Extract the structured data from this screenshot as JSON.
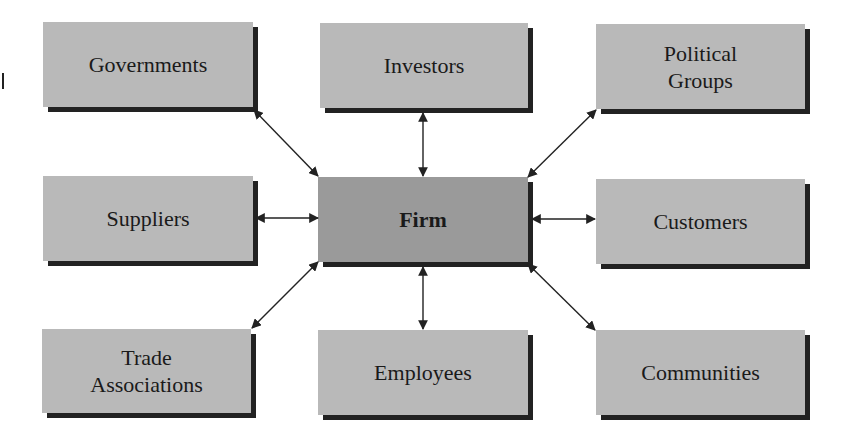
{
  "diagram": {
    "type": "stakeholder-hub",
    "center": {
      "id": "firm",
      "label": "Firm",
      "x": 318,
      "y": 177,
      "w": 210,
      "h": 85
    },
    "nodes": [
      {
        "id": "governments",
        "label": "Governments",
        "x": 43,
        "y": 22,
        "w": 210,
        "h": 85
      },
      {
        "id": "investors",
        "label": "Investors",
        "x": 320,
        "y": 23,
        "w": 208,
        "h": 85
      },
      {
        "id": "political-groups",
        "label": "Political\nGroups",
        "x": 596,
        "y": 24,
        "w": 209,
        "h": 85
      },
      {
        "id": "suppliers",
        "label": "Suppliers",
        "x": 43,
        "y": 176,
        "w": 210,
        "h": 85
      },
      {
        "id": "customers",
        "label": "Customers",
        "x": 596,
        "y": 179,
        "w": 209,
        "h": 85
      },
      {
        "id": "trade-associations",
        "label": "Trade\nAssociations",
        "x": 42,
        "y": 329,
        "w": 209,
        "h": 84
      },
      {
        "id": "employees",
        "label": "Employees",
        "x": 318,
        "y": 330,
        "w": 210,
        "h": 85
      },
      {
        "id": "communities",
        "label": "Communities",
        "x": 596,
        "y": 330,
        "w": 209,
        "h": 85
      }
    ],
    "edges": [
      {
        "from": "firm",
        "to": "governments",
        "x1": 318,
        "y1": 176,
        "x2": 254,
        "y2": 110,
        "bidirectional": true
      },
      {
        "from": "firm",
        "to": "investors",
        "x1": 423,
        "y1": 176,
        "x2": 423,
        "y2": 113,
        "bidirectional": true
      },
      {
        "from": "firm",
        "to": "political-groups",
        "x1": 528,
        "y1": 177,
        "x2": 596,
        "y2": 110,
        "bidirectional": true
      },
      {
        "from": "firm",
        "to": "suppliers",
        "x1": 318,
        "y1": 218,
        "x2": 256,
        "y2": 218,
        "bidirectional": true
      },
      {
        "from": "firm",
        "to": "customers",
        "x1": 532,
        "y1": 219,
        "x2": 595,
        "y2": 219,
        "bidirectional": true
      },
      {
        "from": "firm",
        "to": "trade-associations",
        "x1": 318,
        "y1": 262,
        "x2": 252,
        "y2": 328,
        "bidirectional": true
      },
      {
        "from": "firm",
        "to": "employees",
        "x1": 423,
        "y1": 267,
        "x2": 423,
        "y2": 329,
        "bidirectional": true
      },
      {
        "from": "firm",
        "to": "communities",
        "x1": 528,
        "y1": 264,
        "x2": 595,
        "y2": 330,
        "bidirectional": true
      }
    ],
    "colors": {
      "box": "#b9b9b9",
      "center_box": "#9a9a9a",
      "shadow": "#222222",
      "arrow": "#222222",
      "text": "#1a1a1a"
    }
  }
}
